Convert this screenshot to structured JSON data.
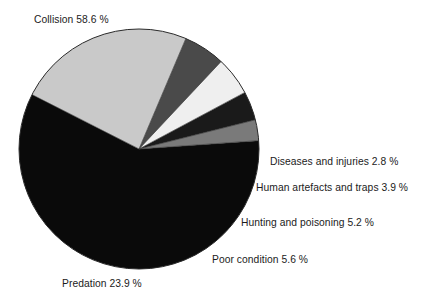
{
  "chart_data": {
    "type": "pie",
    "title": "",
    "subtitle": "",
    "xlabel": "",
    "ylabel": "",
    "legend_position": "none",
    "grid": false,
    "unit": "%",
    "categories": [
      "Collision",
      "Diseases and injuries",
      "Human artefacts and traps",
      "Hunting and poisoning",
      "Poor condition",
      "Predation"
    ],
    "values": [
      58.6,
      2.8,
      3.9,
      5.2,
      5.6,
      23.9
    ],
    "slices": [
      {
        "label": "Collision",
        "value": 58.6,
        "text": "Collision 58.6 %",
        "color": "#0a0a0a",
        "start_angle": 356.0,
        "end_angle": 566.96
      },
      {
        "label": "Diseases and injuries",
        "value": 2.8,
        "text": "Diseases and injuries 2.8 %",
        "color": "#7a7a7a",
        "start_angle": 345.92,
        "end_angle": 356.0
      },
      {
        "label": "Human artefacts and traps",
        "value": 3.9,
        "text": "Human artefacts and traps 3.9 %",
        "color": "#1a1a1a",
        "start_angle": 331.88,
        "end_angle": 345.92
      },
      {
        "label": "Hunting and poisoning",
        "value": 5.2,
        "text": "Hunting and poisoning 5.2 %",
        "color": "#efefef",
        "start_angle": 313.16,
        "end_angle": 331.88
      },
      {
        "label": "Poor condition",
        "value": 5.6,
        "text": "Poor condition 5.6 %",
        "color": "#4a4a4a",
        "start_angle": 292.99,
        "end_angle": 313.16
      },
      {
        "label": "Predation",
        "value": 23.9,
        "text": "Predation 23.9 %",
        "color": "#c9c9c9",
        "start_angle": 206.95,
        "end_angle": 292.99
      }
    ],
    "geometry": {
      "center_x": 139,
      "center_y": 149,
      "radius": 120,
      "outline_color": "#2b2b2b"
    }
  },
  "labels": {
    "collision": "Collision 58.6 %",
    "diseases": "Diseases and injuries 2.8 %",
    "artefacts": "Human artefacts and traps 3.9 %",
    "hunting": "Hunting and poisoning 5.2 %",
    "poor_condition": "Poor condition 5.6 %",
    "predation": "Predation 23.9 %"
  }
}
